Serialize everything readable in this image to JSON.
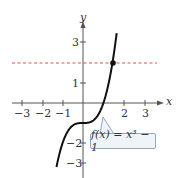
{
  "chart_data": {
    "type": "line",
    "title": "",
    "xlabel": "x",
    "ylabel": "y",
    "xlim": [
      -3.5,
      3.9
    ],
    "ylim": [
      -3.5,
      3.6
    ],
    "x_ticks": [
      -3,
      -2,
      -1,
      2,
      3
    ],
    "x_tick_labels": [
      "−3",
      "−2",
      "−1",
      "2",
      "3"
    ],
    "y_ticks": [
      3,
      1,
      -2,
      -3
    ],
    "y_tick_labels": [
      "3",
      "1",
      "−2",
      "−3"
    ],
    "grid": false,
    "series": [
      {
        "name": "f(x) = x^3 - 1",
        "function": "x^3 - 1",
        "x_range": [
          -1.3,
          1.65
        ],
        "color": "#111111"
      }
    ],
    "reference_lines": [
      {
        "type": "horizontal",
        "y": 2,
        "style": "dashed",
        "color": "#d9534f"
      }
    ],
    "points": [
      {
        "x": 1.442,
        "y": 2,
        "label": ""
      }
    ],
    "annotations": [
      {
        "text": "f(x) = x³ − 1",
        "points_to": [
          1,
          0
        ]
      }
    ]
  },
  "labels": {
    "x_axis": "x",
    "y_axis": "y",
    "callout_text": "f(x) = x³ − 1",
    "xticks": [
      "−3",
      "−2",
      "−1",
      "2",
      "3"
    ],
    "yticks": [
      "3",
      "1",
      "−2",
      "−3"
    ]
  },
  "colors": {
    "curve": "#111111",
    "axis": "#555555",
    "reference_line": "#d9534f",
    "callout_border": "#8fa9b8",
    "callout_fill": "#eef4f8"
  }
}
